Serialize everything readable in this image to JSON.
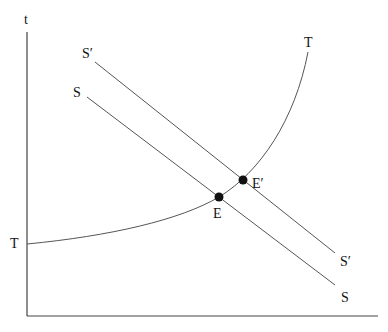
{
  "diagram": {
    "axes": {
      "y_label": "t",
      "x_label": ""
    },
    "curves": [
      {
        "id": "T",
        "label_start": "T",
        "label_end": "T",
        "type": "convex-upward"
      },
      {
        "id": "S",
        "label_start": "S",
        "label_end": "S",
        "type": "downward-line"
      },
      {
        "id": "S_prime",
        "label_start": "S′",
        "label_end": "S′",
        "type": "downward-line"
      }
    ],
    "points": [
      {
        "id": "E",
        "label": "E"
      },
      {
        "id": "E_prime",
        "label": "E′"
      }
    ]
  },
  "labels": {
    "y_axis": "t",
    "t_left": "T",
    "t_top": "T",
    "s_top": "S",
    "s_bottom": "S",
    "sp_top": "S′",
    "sp_bottom": "S′",
    "e": "E",
    "ep": "E′"
  }
}
